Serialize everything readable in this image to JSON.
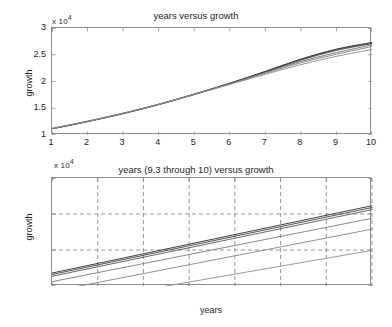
{
  "figure": {
    "background_color": "#ffffff",
    "axis_color": "#8d8d8d",
    "text_color": "#242424",
    "line_color_dark": "#2a2a2a",
    "line_color_light": "#8a8a8a"
  },
  "chart_data": [
    {
      "id": "top",
      "type": "line",
      "title": "years versus growth",
      "xlabel": "",
      "ylabel": "growth",
      "y_exponent_label": "x 10",
      "y_exponent_power": "4",
      "y_exponent_multiplier": 10000,
      "xlim": [
        1,
        10
      ],
      "ylim": [
        10000,
        30000
      ],
      "xticks": [
        1,
        2,
        3,
        4,
        5,
        6,
        7,
        8,
        9,
        10
      ],
      "xticklabels": [
        "1",
        "2",
        "3",
        "4",
        "5",
        "6",
        "7",
        "8",
        "9",
        "10"
      ],
      "yticks": [
        10000,
        15000,
        20000,
        25000,
        30000
      ],
      "yticklabels": [
        "1",
        "1.5",
        "2",
        "2.5",
        "3"
      ],
      "grid": false,
      "box": true,
      "legend": "none",
      "x": [
        1,
        2,
        3,
        4,
        5,
        6,
        7,
        8,
        9,
        10
      ],
      "series": [
        {
          "name": "curve-1",
          "color": "#2a2a2a",
          "values": [
            11200,
            12550,
            14050,
            15750,
            17650,
            19700,
            21900,
            24200,
            26050,
            27300
          ]
        },
        {
          "name": "curve-2",
          "color": "#3a3a3a",
          "values": [
            11180,
            12520,
            14010,
            15700,
            17600,
            19650,
            21850,
            24100,
            25950,
            27200
          ]
        },
        {
          "name": "curve-3",
          "color": "#4a4a4a",
          "values": [
            11150,
            12500,
            13980,
            15660,
            17550,
            19600,
            21780,
            24000,
            25800,
            27100
          ]
        },
        {
          "name": "curve-4",
          "color": "#6e6e6e",
          "values": [
            11150,
            12510,
            14000,
            15700,
            17600,
            19620,
            21700,
            23750,
            25400,
            26850
          ]
        },
        {
          "name": "curve-5",
          "color": "#7d7d7d",
          "values": [
            11200,
            12560,
            14050,
            15740,
            17600,
            19550,
            21550,
            23500,
            25100,
            26550
          ]
        },
        {
          "name": "curve-6",
          "color": "#8a8a8a",
          "values": [
            11250,
            12600,
            14100,
            15750,
            17550,
            19450,
            21350,
            23150,
            24700,
            26000
          ]
        }
      ]
    },
    {
      "id": "bottom",
      "type": "line",
      "title": "years (9.3 through 10) versus growth",
      "xlabel": "years",
      "ylabel": "growth",
      "y_exponent_label": "x 10",
      "y_exponent_power": "4",
      "y_exponent_multiplier": 10000,
      "xlim": [
        9.3,
        10
      ],
      "ylim": [
        25000,
        28000
      ],
      "xticks": [
        9.3,
        9.4,
        9.5,
        9.6,
        9.7,
        9.8,
        9.9,
        10
      ],
      "xticklabels": [
        "9.3",
        "9.4",
        "9.5",
        "9.6",
        "9.7",
        "9.8",
        "9.9",
        "10"
      ],
      "yticks": [
        25000,
        26000,
        27000,
        28000
      ],
      "yticklabels": [
        "2.5",
        "2.6",
        "2.7",
        "2.8"
      ],
      "grid": true,
      "grid_style": "dashed",
      "box": true,
      "legend": "none",
      "x": [
        9.3,
        10
      ],
      "series": [
        {
          "name": "line-1",
          "color": "#2a2a2a",
          "values": [
            25360,
            27230
          ]
        },
        {
          "name": "line-2",
          "color": "#3d3d3d",
          "values": [
            25320,
            27180
          ]
        },
        {
          "name": "line-3",
          "color": "#555555",
          "values": [
            25270,
            27120
          ]
        },
        {
          "name": "line-4",
          "color": "#7a7a7a",
          "values": [
            25120,
            26880
          ]
        },
        {
          "name": "line-5",
          "color": "#858585",
          "values": [
            24850,
            26580
          ]
        },
        {
          "name": "line-6",
          "color": "#8f8f8f",
          "values": [
            24450,
            25990
          ]
        }
      ]
    }
  ]
}
